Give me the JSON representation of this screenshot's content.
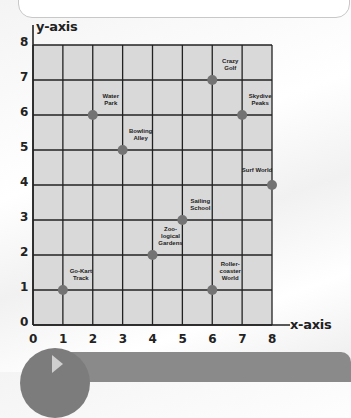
{
  "chart_data": {
    "type": "scatter",
    "title": "",
    "xlabel": "x-axis",
    "ylabel": "y-axis",
    "xlim": [
      0,
      8
    ],
    "ylim": [
      0,
      8
    ],
    "grid": true,
    "x_ticks": [
      "0",
      "1",
      "2",
      "3",
      "4",
      "5",
      "6",
      "7",
      "8"
    ],
    "y_ticks": [
      "0",
      "1",
      "2",
      "3",
      "4",
      "5",
      "6",
      "7",
      "8"
    ],
    "points": [
      {
        "label": "Go-Kart\nTrack",
        "x": 1,
        "y": 1
      },
      {
        "label": "Water\nPark",
        "x": 2,
        "y": 6
      },
      {
        "label": "Bowling\nAlley",
        "x": 3,
        "y": 5
      },
      {
        "label": "Zoo-\nlogical\nGardens",
        "x": 4,
        "y": 2
      },
      {
        "label": "Sailing\nSchool",
        "x": 5,
        "y": 3
      },
      {
        "label": "Crazy\nGolf",
        "x": 6,
        "y": 7
      },
      {
        "label": "Roller-\ncoaster\nWorld",
        "x": 6,
        "y": 1
      },
      {
        "label": "Skydive\nPeaks",
        "x": 7,
        "y": 6
      },
      {
        "label": "Surf World",
        "x": 8,
        "y": 4
      }
    ],
    "colors": {
      "grid_fill": "#d9d9d9",
      "grid_line": "#222222",
      "point": "#737373"
    }
  }
}
